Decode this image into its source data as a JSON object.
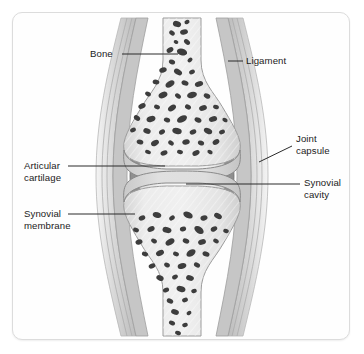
{
  "figure": {
    "background_color": "#ffffff",
    "frame_color": "#dcdcdc",
    "label_color": "#1b1b1b",
    "leader_line_color": "#2b2b2b"
  },
  "labels": {
    "bone": "Bone",
    "ligament": "Ligament",
    "joint_capsule_line1": "Joint",
    "joint_capsule_line2": "capsule",
    "synovial_cavity_line1": "Synovial",
    "synovial_cavity_line2": "cavity",
    "articular_cartilage_line1": "Articular",
    "articular_cartilage_line2": "cartilage",
    "synovial_membrane_line1": "Synovial",
    "synovial_membrane_line2": "membrane"
  },
  "structures": {
    "bone_fill": "#e8e8e8",
    "bone_outline": "#9a9a9a",
    "trabeculae_color": "#3d3d3d",
    "cartilage_fill": "#dcdcdc",
    "cartilage_outline": "#8a8a8a",
    "synovial_cavity_fill": "#f6f6f6",
    "synovial_membrane_color": "#808080",
    "joint_capsule_color": "#b4b4b4",
    "ligament_color": "#d2d2d2"
  }
}
